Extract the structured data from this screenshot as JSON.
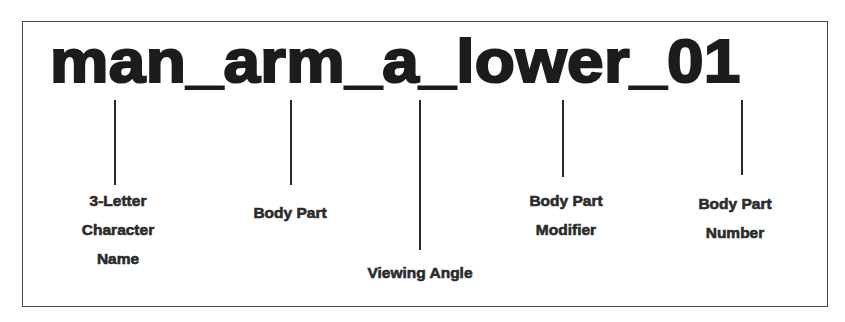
{
  "diagram": {
    "title": "man_arm_a_lower_01",
    "segments": [
      {
        "token": "man",
        "label_lines": [
          "3-Letter",
          "Character",
          "Name"
        ]
      },
      {
        "token": "arm",
        "label_lines": [
          "Body Part"
        ]
      },
      {
        "token": "a",
        "label_lines": [
          "Viewing Angle"
        ]
      },
      {
        "token": "lower",
        "label_lines": [
          "Body Part",
          "Modifier"
        ]
      },
      {
        "token": "01",
        "label_lines": [
          "Body Part",
          "Number"
        ]
      }
    ],
    "colors": {
      "text": "#1c1c1c",
      "lines": "#2a2a2a",
      "border": "#4a4a4a",
      "background": "#ffffff"
    }
  }
}
